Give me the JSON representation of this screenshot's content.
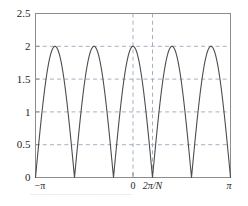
{
  "chart_data": {
    "type": "line",
    "title": "",
    "subtitle": "",
    "xlabel": "",
    "ylabel": "",
    "xlim": [
      -3.14159265,
      3.14159265
    ],
    "ylim": [
      0,
      2.5
    ],
    "grid": true,
    "grid_style": "dashed",
    "legend": null,
    "series": [
      {
        "name": "|2 cos(5x/2)|",
        "formula": "y = 2*|cos(2.5*x)|",
        "color": "#4d4d4d",
        "linewidth": 1.1,
        "peaks_y": 2,
        "minima_y": 0,
        "n_minima": 5,
        "n_peaks": 6,
        "peaks_x": [
          -3.14159265,
          -1.88495559,
          -0.62831853,
          0.62831853,
          1.88495559,
          3.14159265
        ],
        "minima_x": [
          -2.51327412,
          -1.25663706,
          0,
          1.25663706,
          2.51327412
        ]
      }
    ],
    "yticks": [
      0,
      0.5,
      1,
      1.5,
      2,
      2.5
    ],
    "ytick_labels": [
      "0",
      "0.5",
      "1",
      "1.5",
      "2",
      "2.5"
    ],
    "xticks": [
      -3.14159265,
      -1.88495559,
      -0.62831853,
      0.0,
      0.62831853,
      1.88495559,
      3.14159265
    ],
    "xtick_labels_shown": [
      {
        "value": -3.14159265,
        "text": "−π",
        "italic": false
      },
      {
        "value": 0.0,
        "text": "0",
        "italic": false
      },
      {
        "value": 0.62831853,
        "text": "2π/N",
        "italic": true
      },
      {
        "value": 3.14159265,
        "text": "π",
        "italic": true
      }
    ],
    "vertical_gridlines": [
      0.0,
      0.62831853
    ],
    "horizontal_gridlines": [
      0.5,
      1.0,
      1.5,
      2.0
    ],
    "minor_tick_values": [
      -1.88495559,
      -0.62831853,
      1.88495559
    ]
  },
  "colors": {
    "curve": "#4d4d4d",
    "grid": "#9aa6bb",
    "axis": "#8c8c8c",
    "text": "#262626",
    "background": "#ffffff",
    "caption": "#c9c9c9"
  },
  "caption": {
    "text": "——————————————"
  }
}
